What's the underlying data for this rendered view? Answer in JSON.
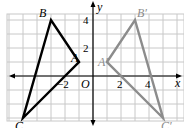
{
  "diagram": {
    "type": "coordinate-grid-reflection",
    "grid": {
      "origin_px": [
        93,
        76
      ],
      "unit_px": 14,
      "x_range": [
        -6,
        6
      ],
      "y_range": [
        -3,
        5
      ],
      "line_color": "#c8c8c8"
    },
    "axes": {
      "x_label": "x",
      "y_label": "y",
      "origin_label": "O",
      "color": "#000000"
    },
    "ticks": {
      "x": [
        {
          "value": -2,
          "label": "−2"
        },
        {
          "value": 2,
          "label": "2"
        },
        {
          "value": 4,
          "label": "4"
        }
      ],
      "y": [
        {
          "value": 2,
          "label": "2"
        },
        {
          "value": 4,
          "label": "4"
        }
      ]
    },
    "triangles": [
      {
        "name": "ABC",
        "color": "#000000",
        "vertices": [
          {
            "label": "A",
            "x": -1,
            "y": 1
          },
          {
            "label": "B",
            "x": -3,
            "y": 4
          },
          {
            "label": "C",
            "x": -5,
            "y": -3
          }
        ]
      },
      {
        "name": "A'B'C'",
        "color": "#8c8c8c",
        "vertices": [
          {
            "label": "A′",
            "x": 1,
            "y": 1
          },
          {
            "label": "B′",
            "x": 3,
            "y": 4
          },
          {
            "label": "C′",
            "x": 5,
            "y": -3
          }
        ]
      }
    ]
  }
}
